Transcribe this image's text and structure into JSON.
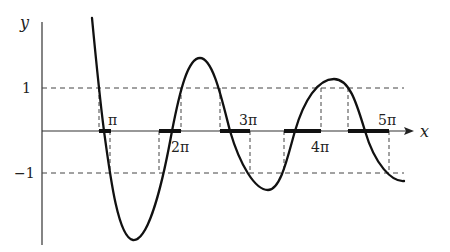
{
  "figure": {
    "axes": {
      "x_label": "x",
      "y_label": "y",
      "y_ticks": [
        {
          "label": "1",
          "value": 1
        },
        {
          "label": "−1",
          "value": -1
        }
      ],
      "x_ticks": [
        {
          "label": "π",
          "value": "pi"
        },
        {
          "label": "2π",
          "value": "2pi"
        },
        {
          "label": "3π",
          "value": "3pi"
        },
        {
          "label": "4π",
          "value": "4pi"
        },
        {
          "label": "5π",
          "value": "5pi"
        }
      ]
    },
    "reference_lines": [
      {
        "name": "y=1",
        "style": "dashed"
      },
      {
        "name": "y=-1",
        "style": "dashed"
      }
    ],
    "curve": {
      "description": "Damped oscillation decaying toward the band -1 <= y <= 1",
      "color": "#111111"
    },
    "highlighted_intervals_on_x_axis": 5
  }
}
